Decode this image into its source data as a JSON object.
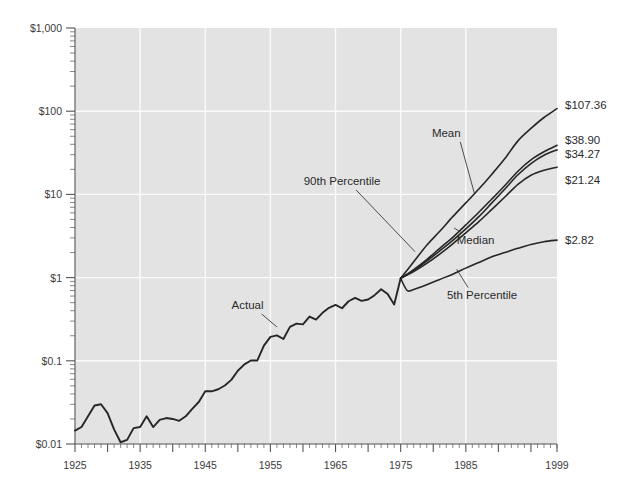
{
  "chart_data": {
    "type": "line",
    "title": "",
    "subtitle": "",
    "xlabel": "",
    "ylabel": "",
    "yscale": "log",
    "ylim": [
      0.01,
      1000
    ],
    "xlim": [
      1925,
      1999
    ],
    "grid": true,
    "legend_position": "inline-annotations",
    "y_tick_labels": [
      "$1,000",
      "$100",
      "$10",
      "$1",
      "$0.1",
      "$0.01"
    ],
    "y_tick_values": [
      1000,
      100,
      10,
      1,
      0.1,
      0.01
    ],
    "x_tick_labels": [
      "1925",
      "1935",
      "1945",
      "1955",
      "1965",
      "1975",
      "1985",
      "1999"
    ],
    "x_tick_values": [
      1925,
      1935,
      1945,
      1955,
      1965,
      1975,
      1985,
      1999
    ],
    "annotations": [
      {
        "text": "Actual",
        "x": 1951.5,
        "y": 0.42
      },
      {
        "text": "90th Percentile",
        "x": 1966.0,
        "y": 13.0
      },
      {
        "text": "Mean",
        "x": 1982.0,
        "y": 49.0
      },
      {
        "text": "Median",
        "x": 1986.5,
        "y": 2.55
      },
      {
        "text": "5th Percentile",
        "x": 1987.5,
        "y": 0.56
      }
    ],
    "end_labels": [
      {
        "text": "$107.36",
        "value": 107.36,
        "series": "90th Percentile"
      },
      {
        "text": "$38.90",
        "value": 38.9,
        "series": "Mean"
      },
      {
        "text": "$34.27",
        "value": 34.27,
        "series": "Upper-mid"
      },
      {
        "text": "$21.24",
        "value": 21.24,
        "series": "Median"
      },
      {
        "text": "$2.82",
        "value": 2.82,
        "series": "5th Percentile"
      }
    ],
    "series": [
      {
        "name": "Actual",
        "x": [
          1925,
          1926,
          1927,
          1928,
          1929,
          1930,
          1931,
          1932,
          1933,
          1934,
          1935,
          1936,
          1937,
          1938,
          1939,
          1940,
          1941,
          1942,
          1943,
          1944,
          1945,
          1946,
          1947,
          1948,
          1949,
          1950,
          1951,
          1952,
          1953,
          1954,
          1955,
          1956,
          1957,
          1958,
          1959,
          1960,
          1961,
          1962,
          1963,
          1964,
          1965,
          1966,
          1967,
          1968,
          1969,
          1970,
          1971,
          1972,
          1973,
          1974,
          1975
        ],
        "y": [
          0.0145,
          0.016,
          0.0215,
          0.029,
          0.03,
          0.0235,
          0.015,
          0.0105,
          0.0112,
          0.0155,
          0.016,
          0.0215,
          0.016,
          0.0195,
          0.0205,
          0.02,
          0.019,
          0.0215,
          0.0265,
          0.032,
          0.043,
          0.043,
          0.0455,
          0.0505,
          0.059,
          0.076,
          0.0905,
          0.101,
          0.101,
          0.152,
          0.194,
          0.202,
          0.183,
          0.256,
          0.28,
          0.274,
          0.34,
          0.313,
          0.377,
          0.433,
          0.47,
          0.428,
          0.52,
          0.57,
          0.525,
          0.545,
          0.615,
          0.725,
          0.635,
          0.475,
          0.98
        ]
      },
      {
        "name": "90th Percentile",
        "x": [
          1975,
          1977,
          1979,
          1981,
          1983,
          1985,
          1987,
          1989,
          1991,
          1993,
          1995,
          1997,
          1999
        ],
        "y": [
          0.98,
          1.55,
          2.45,
          3.6,
          5.4,
          7.9,
          11.6,
          17.5,
          27.0,
          44.0,
          62.0,
          84.0,
          107.36
        ]
      },
      {
        "name": "Mean",
        "x": [
          1975,
          1977,
          1979,
          1981,
          1983,
          1985,
          1987,
          1989,
          1991,
          1993,
          1995,
          1997,
          1999
        ],
        "y": [
          0.98,
          1.25,
          1.65,
          2.25,
          3.05,
          4.3,
          6.1,
          8.8,
          12.8,
          19.0,
          26.0,
          32.5,
          38.9
        ]
      },
      {
        "name": "Upper-mid",
        "x": [
          1975,
          1977,
          1979,
          1981,
          1983,
          1985,
          1987,
          1989,
          1991,
          1993,
          1995,
          1997,
          1999
        ],
        "y": [
          0.98,
          1.22,
          1.58,
          2.1,
          2.8,
          3.85,
          5.4,
          7.9,
          11.6,
          17.2,
          23.5,
          29.5,
          34.27
        ]
      },
      {
        "name": "Median",
        "x": [
          1975,
          1977,
          1979,
          1981,
          1983,
          1985,
          1987,
          1989,
          1991,
          1993,
          1995,
          1997,
          1999
        ],
        "y": [
          0.98,
          1.18,
          1.48,
          1.92,
          2.55,
          3.45,
          4.7,
          6.6,
          9.3,
          13.2,
          17.0,
          19.5,
          21.24
        ]
      },
      {
        "name": "5th Percentile",
        "x": [
          1975,
          1976,
          1977,
          1979,
          1981,
          1983,
          1985,
          1987,
          1989,
          1991,
          1993,
          1995,
          1997,
          1999
        ],
        "y": [
          0.98,
          0.7,
          0.72,
          0.82,
          0.95,
          1.1,
          1.3,
          1.52,
          1.78,
          2.0,
          2.25,
          2.5,
          2.7,
          2.82
        ]
      }
    ]
  },
  "layout": {
    "plot_left": 75,
    "plot_right": 557,
    "plot_top": 28,
    "plot_bottom": 444
  }
}
